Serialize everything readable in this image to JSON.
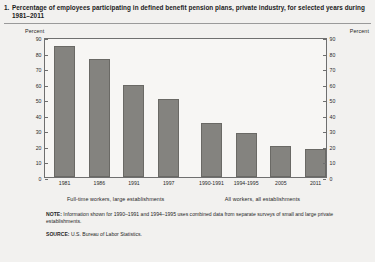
{
  "title": {
    "number": "1.",
    "text": "Percentage of employees participating in defined benefit pension plans, private industry, for selected years during 1981–2011"
  },
  "axis_caption_left": "Percent",
  "axis_caption_right": "Percent",
  "footnotes": {
    "note_lead": "NOTE:",
    "note_text": "Information shown for 1990–1991 and 1994–1995 uses combined data from separate surveys of small and large private establishments.",
    "source_lead": "SOURCE:",
    "source_text": "U.S. Bureau of Labor Statistics."
  },
  "chart_data": {
    "type": "bar",
    "title": "Percentage of employees participating in defined benefit pension plans, private industry, for selected years during 1981–2011",
    "xlabel": "",
    "ylabel": "Percent",
    "ylim": [
      0,
      90
    ],
    "yticks": [
      0,
      10,
      20,
      30,
      40,
      50,
      60,
      70,
      80,
      90
    ],
    "grid": false,
    "legend": "none",
    "bar_color": "#84837f",
    "categories": [
      "1981",
      "1986",
      "1991",
      "1997",
      "1990-1991",
      "1994-1995",
      "2005",
      "2011"
    ],
    "values": [
      84,
      76,
      59,
      50,
      35,
      28,
      20,
      18
    ],
    "groups": [
      {
        "label": "Full-time workers, large establishments",
        "categories": [
          "1981",
          "1986",
          "1991",
          "1997"
        ],
        "values": [
          84,
          76,
          59,
          50
        ]
      },
      {
        "label": "All workers, all establishments",
        "categories": [
          "1990-1991",
          "1994-1995",
          "2005",
          "2011"
        ],
        "values": [
          35,
          28,
          20,
          18
        ]
      }
    ]
  }
}
